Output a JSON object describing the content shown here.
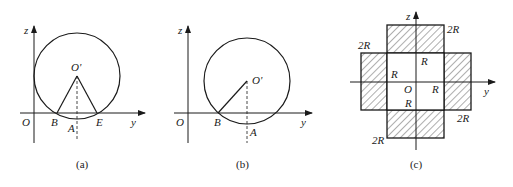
{
  "figures": [
    {
      "id": "a",
      "caption": "(a)",
      "labels": {
        "z": "z",
        "y": "y",
        "origin": "O",
        "center": "O'",
        "B": "B",
        "A": "A",
        "E": "E"
      }
    },
    {
      "id": "b",
      "caption": "(b)",
      "labels": {
        "z": "z",
        "y": "y",
        "origin": "O",
        "center": "O'",
        "B": "B",
        "A": "A"
      }
    },
    {
      "id": "c",
      "caption": "(c)",
      "labels": {
        "z": "z",
        "y": "y",
        "origin": "O",
        "top_right": "2R",
        "left_top": "2R",
        "right_bottom": "2R",
        "bottom_left": "2R",
        "inner_top": "R",
        "inner_left": "R",
        "inner_right": "R",
        "inner_bottom": "R"
      }
    }
  ],
  "colors": {
    "stroke": "#1a1a1a",
    "hatch": "#333333",
    "background": "#ffffff"
  }
}
